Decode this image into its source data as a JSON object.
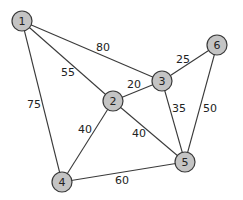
{
  "graph": {
    "nodes": [
      {
        "id": "1",
        "label": "1",
        "x": 22,
        "y": 21
      },
      {
        "id": "2",
        "label": "2",
        "x": 113,
        "y": 101
      },
      {
        "id": "3",
        "label": "3",
        "x": 162,
        "y": 81
      },
      {
        "id": "4",
        "label": "4",
        "x": 62,
        "y": 182
      },
      {
        "id": "5",
        "label": "5",
        "x": 185,
        "y": 162
      },
      {
        "id": "6",
        "label": "6",
        "x": 217,
        "y": 45
      }
    ],
    "edges": [
      {
        "from": "1",
        "to": "3",
        "weight": "80",
        "lx": 103,
        "ly": 47
      },
      {
        "from": "1",
        "to": "2",
        "weight": "55",
        "lx": 68,
        "ly": 72
      },
      {
        "from": "1",
        "to": "4",
        "weight": "75",
        "lx": 34,
        "ly": 104
      },
      {
        "from": "2",
        "to": "3",
        "weight": "20",
        "lx": 134,
        "ly": 84
      },
      {
        "from": "2",
        "to": "4",
        "weight": "40",
        "lx": 85,
        "ly": 129
      },
      {
        "from": "2",
        "to": "5",
        "weight": "40",
        "lx": 139,
        "ly": 133
      },
      {
        "from": "3",
        "to": "6",
        "weight": "25",
        "lx": 183,
        "ly": 59
      },
      {
        "from": "3",
        "to": "5",
        "weight": "35",
        "lx": 179,
        "ly": 108
      },
      {
        "from": "6",
        "to": "5",
        "weight": "50",
        "lx": 210,
        "ly": 108
      },
      {
        "from": "4",
        "to": "5",
        "weight": "60",
        "lx": 122,
        "ly": 180
      }
    ],
    "node_radius": 10,
    "colors": {
      "node_fill": "#c4c4c4",
      "stroke": "#3a3a3a",
      "text": "#222222",
      "background": "#ffffff"
    }
  }
}
